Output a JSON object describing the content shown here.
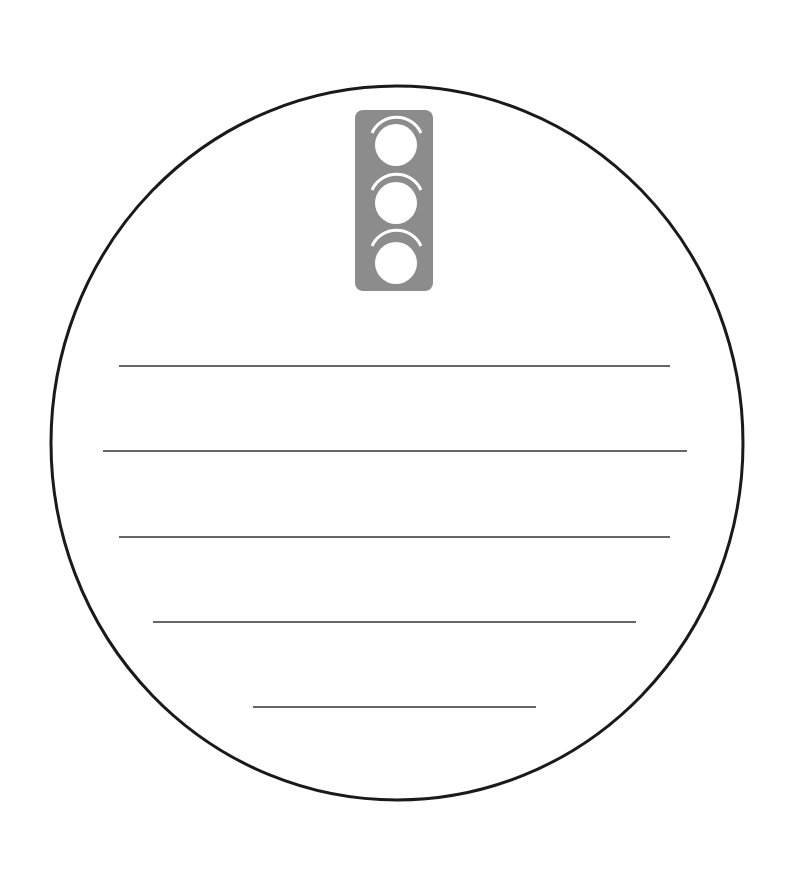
{
  "worksheet": {
    "shape": "circle",
    "icon": "traffic-light-icon",
    "colors": {
      "outline": "#1a1a1a",
      "icon_body": "#8c8c8c",
      "icon_lights": "#ffffff",
      "writing_lines": "#333333",
      "background": "#ffffff"
    },
    "writing_lines": [
      {
        "x1": 119,
        "x2": 670,
        "y": 366
      },
      {
        "x1": 103,
        "x2": 687,
        "y": 451
      },
      {
        "x1": 119,
        "x2": 670,
        "y": 537
      },
      {
        "x1": 153,
        "x2": 636,
        "y": 622
      },
      {
        "x1": 253,
        "x2": 536,
        "y": 707
      }
    ]
  }
}
